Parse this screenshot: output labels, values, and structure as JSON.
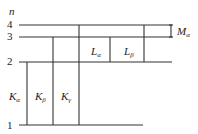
{
  "diagram": {
    "axis_label": "n",
    "levels": [
      {
        "n": "4",
        "label": "4"
      },
      {
        "n": "3",
        "label": "3"
      },
      {
        "n": "2",
        "label": "2"
      },
      {
        "n": "1",
        "label": "1"
      }
    ],
    "transitions": {
      "k_alpha": {
        "base": "K",
        "sub": "α"
      },
      "k_beta": {
        "base": "K",
        "sub": "β"
      },
      "k_gamma": {
        "base": "K",
        "sub": "γ"
      },
      "l_alpha": {
        "base": "L",
        "sub": "α"
      },
      "l_beta": {
        "base": "L",
        "sub": "β"
      },
      "m_alpha": {
        "base": "M",
        "sub": "α"
      }
    },
    "colors": {
      "line": "#333333",
      "text": "#222222",
      "background": "#ffffff"
    }
  }
}
